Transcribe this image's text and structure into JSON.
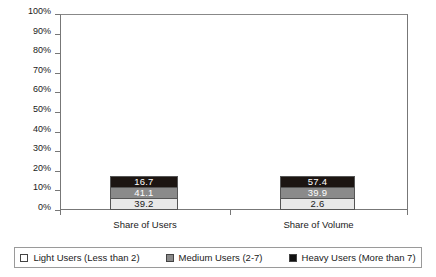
{
  "chart_data": {
    "type": "bar",
    "stacked": true,
    "title": "",
    "subtitle": "",
    "xlabel": "",
    "ylabel": "",
    "ylim": [
      0,
      100
    ],
    "y_tick_labels": [
      "100%",
      "90%",
      "80%",
      "70%",
      "60%",
      "50%",
      "40%",
      "30%",
      "20%",
      "10%",
      "0%"
    ],
    "y_tick_values": [
      100,
      90,
      80,
      70,
      60,
      50,
      40,
      30,
      20,
      10,
      0
    ],
    "grid": false,
    "legend_position": "bottom",
    "categories": [
      "Share of Users",
      "Share of Volume"
    ],
    "series": [
      {
        "name": "Light Users (Less than 2)",
        "color": "#e8e8e8",
        "values": [
          39.2,
          2.6
        ],
        "labels": [
          "39.2",
          "2.6"
        ]
      },
      {
        "name": "Medium Users (2-7)",
        "color": "#8a8a8a",
        "values": [
          41.1,
          39.9
        ],
        "labels": [
          "41.1",
          "39.9"
        ]
      },
      {
        "name": "Heavy Users (More than 7)",
        "color": "#1c1512",
        "values": [
          16.7,
          57.4
        ],
        "labels": [
          "16.7",
          "57.4"
        ]
      }
    ]
  },
  "legend": {
    "items": [
      {
        "label": "Light Users (Less than 2)"
      },
      {
        "label": "Medium Users (2-7)"
      },
      {
        "label": "Heavy Users (More than 7)"
      }
    ]
  }
}
